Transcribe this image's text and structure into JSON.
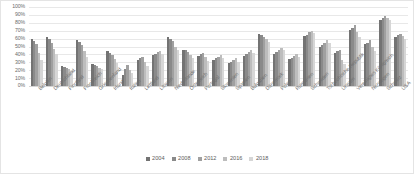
{
  "chart": {
    "type": "bar",
    "orientation": "vertical-grouped",
    "background_color": "#ffffff",
    "border_color": "#e4e4e4",
    "gridline_color": "#e8e8e8",
    "grid": true,
    "legend_position": "bottom"
  },
  "chart_data": {
    "type": "bar",
    "title": "",
    "subtitle": "",
    "xlabel": "",
    "ylabel": "",
    "ylim": [
      0,
      100
    ],
    "yticks": [
      "0%",
      "10%",
      "20%",
      "30%",
      "40%",
      "50%",
      "60%",
      "70%",
      "80%",
      "90%",
      "100%"
    ],
    "ytick_values": [
      0,
      10,
      20,
      30,
      40,
      50,
      60,
      70,
      80,
      90,
      100
    ],
    "value_unit": "%",
    "grid": true,
    "legend_position": "bottom",
    "categories": [
      "Belgien",
      "Deutschland",
      "Finnland",
      "Frankreich",
      "Griechenland",
      "Irland",
      "Italien",
      "Lettland",
      "Litauen",
      "Niederlande",
      "Österreich",
      "Portugal",
      "Slowenien",
      "Spanien",
      "Bulgarien",
      "Dänemark",
      "Polen",
      "Rumänien",
      "Schweden",
      "Tschechische Republik",
      "Ungarn",
      "Vereinigtes Königreich",
      "Norwegen",
      "Schweiz",
      "USA"
    ],
    "series": [
      {
        "name": "2004",
        "color": "#737373",
        "values": [
          60,
          62,
          25,
          58,
          28,
          44,
          14,
          33,
          39,
          62,
          46,
          38,
          33,
          29,
          38,
          66,
          40,
          34,
          63,
          49,
          42,
          71,
          53,
          83,
          62
        ]
      },
      {
        "name": "2008",
        "color": "#8a8a8a",
        "values": [
          57,
          60,
          24,
          56,
          27,
          42,
          21,
          35,
          41,
          60,
          45,
          40,
          35,
          31,
          40,
          64,
          43,
          36,
          65,
          52,
          44,
          74,
          55,
          86,
          64
        ]
      },
      {
        "name": "2012",
        "color": "#a0a0a0",
        "values": [
          53,
          55,
          23,
          52,
          25,
          39,
          26,
          37,
          43,
          57,
          43,
          42,
          37,
          33,
          43,
          62,
          46,
          38,
          68,
          55,
          46,
          77,
          58,
          88,
          66
        ]
      },
      {
        "name": "2016",
        "color": "#bdbdbd",
        "values": [
          42,
          47,
          21,
          44,
          23,
          34,
          20,
          30,
          44,
          50,
          39,
          37,
          39,
          35,
          45,
          59,
          48,
          40,
          70,
          58,
          33,
          69,
          49,
          86,
          63
        ]
      },
      {
        "name": "2018",
        "color": "#d6d6d6",
        "values": [
          33,
          40,
          19,
          37,
          21,
          29,
          16,
          25,
          41,
          45,
          35,
          32,
          36,
          30,
          42,
          56,
          45,
          37,
          67,
          54,
          28,
          62,
          44,
          84,
          60
        ]
      }
    ]
  },
  "legend": {
    "items": [
      {
        "label": "2004",
        "color": "#737373"
      },
      {
        "label": "2008",
        "color": "#8a8a8a"
      },
      {
        "label": "2012",
        "color": "#a0a0a0"
      },
      {
        "label": "2016",
        "color": "#bdbdbd"
      },
      {
        "label": "2018",
        "color": "#d6d6d6"
      }
    ]
  }
}
